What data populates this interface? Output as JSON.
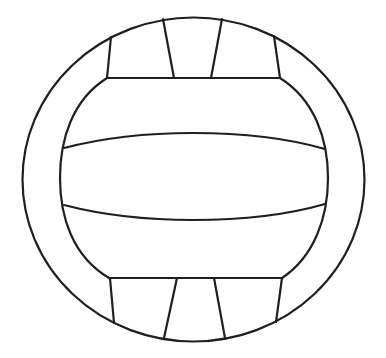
{
  "image": {
    "subject": "volleyball line drawing",
    "background_color": "#ffffff",
    "stroke_color": "#1f1f1f"
  }
}
